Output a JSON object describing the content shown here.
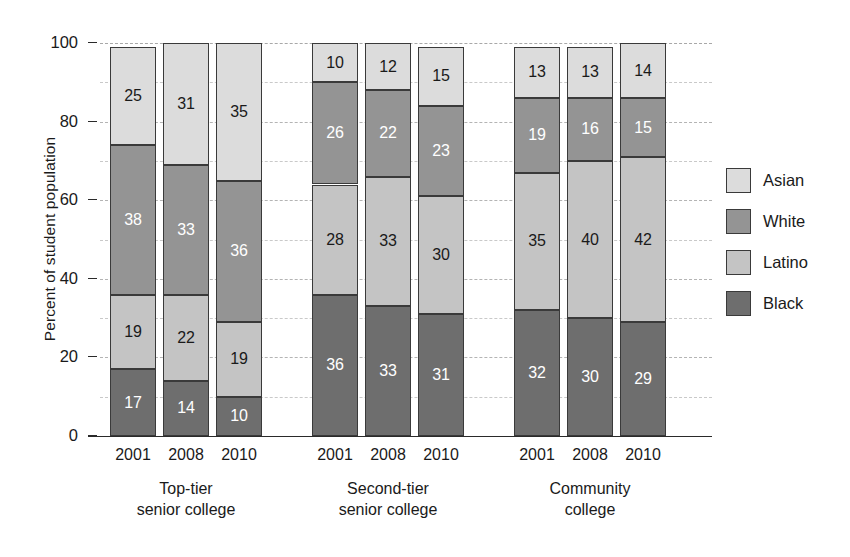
{
  "chart_data": {
    "type": "bar",
    "subtype": "stacked-bar-100",
    "title": "",
    "xlabel": "",
    "ylabel": "Percent of student population",
    "ylim": [
      0,
      100
    ],
    "y_ticks": [
      0,
      20,
      40,
      60,
      80,
      100
    ],
    "y_minor_ticks": [
      10,
      30,
      50,
      70,
      90
    ],
    "grid": true,
    "legend_position": "right",
    "stack_order_bottom_to_top": [
      "Black",
      "Latino",
      "White",
      "Asian"
    ],
    "groups": [
      "Top-tier senior college",
      "Second-tier senior college",
      "Community college"
    ],
    "categories": [
      "2001",
      "2008",
      "2010"
    ],
    "series": [
      {
        "name": "Black",
        "color": "#6e6e6e",
        "label_color": "#ffffff",
        "values": [
          [
            17,
            14,
            10
          ],
          [
            36,
            33,
            31
          ],
          [
            32,
            30,
            29
          ]
        ]
      },
      {
        "name": "Latino",
        "color": "#c4c4c4",
        "label_color": "#1a1a1a",
        "values": [
          [
            19,
            22,
            19
          ],
          [
            28,
            33,
            30
          ],
          [
            35,
            40,
            42
          ]
        ]
      },
      {
        "name": "White",
        "color": "#949494",
        "label_color": "#ffffff",
        "values": [
          [
            38,
            33,
            36
          ],
          [
            26,
            22,
            23
          ],
          [
            19,
            16,
            15
          ]
        ]
      },
      {
        "name": "Asian",
        "color": "#dcdcdc",
        "label_color": "#1a1a1a",
        "values": [
          [
            25,
            31,
            35
          ],
          [
            10,
            12,
            15
          ],
          [
            13,
            13,
            14
          ]
        ]
      }
    ],
    "legend": [
      {
        "label": "Asian",
        "color": "#dcdcdc"
      },
      {
        "label": "White",
        "color": "#949494"
      },
      {
        "label": "Latino",
        "color": "#c4c4c4"
      },
      {
        "label": "Black",
        "color": "#6e6e6e"
      }
    ],
    "group_label_lines": [
      [
        "Top-tier",
        "senior college"
      ],
      [
        "Second-tier",
        "senior college"
      ],
      [
        "Community",
        "college"
      ]
    ]
  }
}
